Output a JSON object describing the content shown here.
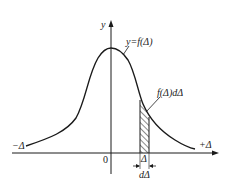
{
  "diagram": {
    "type": "probability-density-curve",
    "labels": {
      "y_axis": "y",
      "curve": "y=f(Δ)",
      "area": "f(Δ)dΔ",
      "neg": "−Δ",
      "pos": "+Δ",
      "origin": "0",
      "delta": "Δ",
      "d_delta": "dΔ"
    },
    "colors": {
      "stroke": "#1a1a1a",
      "background": "#ffffff"
    }
  }
}
